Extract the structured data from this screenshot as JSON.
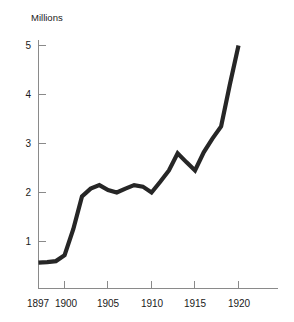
{
  "chart_data": {
    "type": "line",
    "title": "",
    "subtitle": "",
    "xlabel": "",
    "ylabel": "Millions",
    "ylabel_position": "top-left",
    "grid": false,
    "legend": false,
    "legend_position": "none",
    "xlim": [
      1896,
      1922
    ],
    "ylim": [
      0,
      5.3
    ],
    "x_tick_labels": [
      "1897",
      "1900",
      "1905",
      "1910",
      "1915",
      "1920"
    ],
    "x_ticks": [
      1897,
      1900,
      1905,
      1910,
      1915,
      1920
    ],
    "y_tick_labels": [
      "1",
      "2",
      "3",
      "4",
      "5"
    ],
    "y_ticks": [
      1,
      2,
      3,
      4,
      5
    ],
    "line_color": "#262626",
    "axis_color": "#8a8a8a",
    "background_color": "#ffffff",
    "x": [
      1897,
      1898,
      1899,
      1900,
      1901,
      1902,
      1903,
      1904,
      1905,
      1906,
      1907,
      1908,
      1909,
      1910,
      1911,
      1912,
      1913,
      1914,
      1915,
      1916,
      1917,
      1918,
      1919,
      1920
    ],
    "values": [
      0.57,
      0.58,
      0.6,
      0.72,
      1.25,
      1.92,
      2.08,
      2.15,
      2.05,
      2.0,
      2.08,
      2.15,
      2.12,
      2.0,
      2.22,
      2.45,
      2.8,
      2.62,
      2.45,
      2.82,
      3.1,
      3.35,
      4.2,
      5.0
    ],
    "series": [
      {
        "name": "value",
        "values": [
          0.57,
          0.58,
          0.6,
          0.72,
          1.25,
          1.92,
          2.08,
          2.15,
          2.05,
          2.0,
          2.08,
          2.15,
          2.12,
          2.0,
          2.22,
          2.45,
          2.8,
          2.62,
          2.45,
          2.82,
          3.1,
          3.35,
          4.2,
          5.0
        ]
      }
    ]
  },
  "axis": {
    "y_label": "Millions",
    "y_tick_1": "1",
    "y_tick_2": "2",
    "y_tick_3": "3",
    "y_tick_4": "4",
    "y_tick_5": "5",
    "x_tick_1897": "1897",
    "x_tick_1900": "1900",
    "x_tick_1905": "1905",
    "x_tick_1910": "1910",
    "x_tick_1915": "1915",
    "x_tick_1920": "1920"
  }
}
